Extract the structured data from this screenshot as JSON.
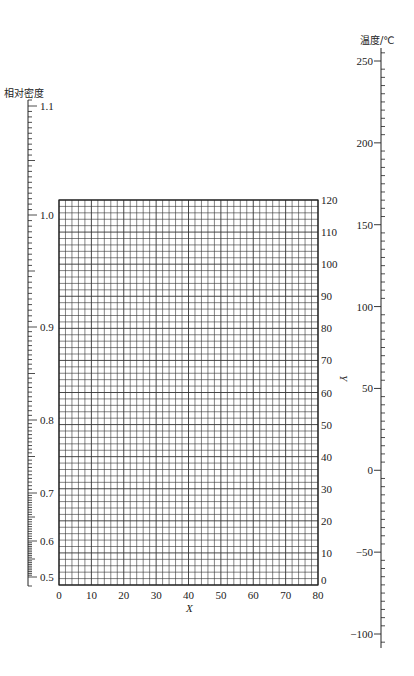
{
  "chart_data": {
    "type": "nomograph",
    "title": "",
    "left_axis": {
      "label": "相对密度",
      "scale": "nonlinear",
      "ticks": [
        {
          "value": "1.1",
          "y": 106
        },
        {
          "value": "1.0",
          "y": 215
        },
        {
          "value": "0.9",
          "y": 327
        },
        {
          "value": "0.8",
          "y": 420
        },
        {
          "value": "0.7",
          "y": 493
        },
        {
          "value": "0.6",
          "y": 541
        },
        {
          "value": "0.5",
          "y": 577
        }
      ]
    },
    "grid": {
      "xlabel": "X",
      "ylabel": "Y",
      "xlim": [
        0,
        80
      ],
      "ylim": [
        0,
        120
      ],
      "x_ticks": [
        "0",
        "10",
        "20",
        "30",
        "40",
        "50",
        "60",
        "70",
        "80"
      ],
      "y_ticks": [
        "0",
        "10",
        "20",
        "30",
        "40",
        "50",
        "60",
        "70",
        "80",
        "90",
        "100",
        "110",
        "120"
      ],
      "cell_x": 2,
      "cell_y": 2
    },
    "right_axis": {
      "label": "温度/℃",
      "scale": "linear",
      "range": [
        -100,
        250
      ],
      "ticks": [
        "250",
        "200",
        "150",
        "100",
        "50",
        "0",
        "−50",
        "−100"
      ]
    }
  }
}
